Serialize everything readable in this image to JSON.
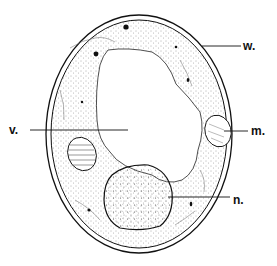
{
  "diagram": {
    "colors": {
      "ink": "#111111",
      "background": "#ffffff",
      "cytoplasm_stipple": "#555555"
    },
    "labels": [
      {
        "id": "w",
        "text": "w.",
        "meaning_target": "cell wall"
      },
      {
        "id": "v",
        "text": "v.",
        "meaning_target": "vacuole"
      },
      {
        "id": "m",
        "text": "m.",
        "meaning_target": "oval body (right)"
      },
      {
        "id": "n",
        "text": "n.",
        "meaning_target": "nucleus"
      }
    ]
  }
}
